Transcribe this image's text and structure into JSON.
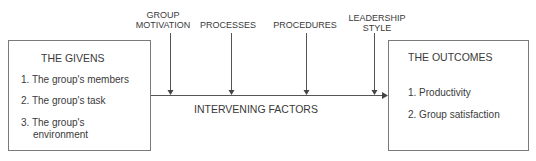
{
  "givens": {
    "title": "THE GIVENS",
    "items": [
      "1. The group's members",
      "2. The group's task",
      "3. The group's",
      "environment"
    ]
  },
  "outcomes": {
    "title": "THE OUTCOMES",
    "items": [
      "1. Productivity",
      "2. Group satisfaction"
    ]
  },
  "center_label": "INTERVENING FACTORS",
  "factors": [
    {
      "line1": "GROUP",
      "line2": "MOTIVATION"
    },
    {
      "line1": "",
      "line2": "PROCESSES"
    },
    {
      "line1": "",
      "line2": "PROCEDURES"
    },
    {
      "line1": "LEADERSHIP",
      "line2": "STYLE"
    }
  ],
  "colors": {
    "line": "#555555",
    "border": "#7a7a7a",
    "text": "#3a3a3a"
  }
}
